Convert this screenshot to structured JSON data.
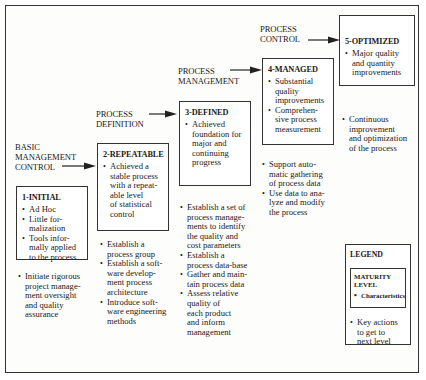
{
  "diagram": {
    "stages": [
      {
        "label_lines": [
          "BASIC",
          "MANAGEMENT",
          "CONTROL"
        ]
      },
      {
        "label_lines": [
          "PROCESS",
          "DEFINITION"
        ]
      },
      {
        "label_lines": [
          "PROCESS",
          "MANAGEMENT"
        ]
      },
      {
        "label_lines": [
          "PROCESS",
          "CONTROL"
        ]
      }
    ],
    "levels": [
      {
        "title": "1-INITIAL",
        "characteristics": [
          "Ad Hoc",
          "Little for-malization",
          "Tools informally applied to the process"
        ],
        "characteristics_lines": [
          [
            "Ad Hoc"
          ],
          [
            "Little for-",
            "malization"
          ],
          [
            "Tools infor-",
            "mally applied",
            "to the process"
          ]
        ],
        "key_actions_lines": [
          [
            "Initiate rigorous",
            "project manage-",
            "ment oversight",
            "and quality",
            "assurance"
          ]
        ]
      },
      {
        "title": "2-REPEATABLE",
        "characteristics_lines": [
          [
            "Achieved a",
            "stable process",
            "with a repeat-",
            "able level",
            "of statistical",
            "control"
          ]
        ],
        "key_actions_lines": [
          [
            "Establish a",
            "process group"
          ],
          [
            "Establish a soft-",
            "ware develop-",
            "ment process",
            "architecture"
          ],
          [
            "Introduce soft-",
            "ware engineering",
            "methods"
          ]
        ]
      },
      {
        "title": "3-DEFINED",
        "characteristics_lines": [
          [
            "Achieved",
            "foundation for",
            "major and",
            "continuing",
            "progress"
          ]
        ],
        "key_actions_lines": [
          [
            "Establish a set of",
            "process manage-",
            "ments to identify",
            "the quality and",
            "cost parameters"
          ],
          [
            "Establish a",
            "process data-base"
          ],
          [
            "Gather and main-",
            "tain process data"
          ],
          [
            "Assess relative",
            "quality of",
            "each product",
            "and inform",
            "management"
          ]
        ]
      },
      {
        "title": "4-MANAGED",
        "characteristics_lines": [
          [
            "Substantial",
            "quality",
            "improvements"
          ],
          [
            "Comprehen-",
            "sive process",
            "measurement"
          ]
        ],
        "key_actions_lines": [
          [
            "Support auto-",
            "matic gathering",
            "of process data"
          ],
          [
            "Use data to ana-",
            "lyze and modify",
            "the process"
          ]
        ]
      },
      {
        "title": "5-OPTIMIZED",
        "characteristics_lines": [
          [
            "Major quality",
            "and quantity",
            "improvements"
          ]
        ],
        "key_actions_lines": [
          [
            "Continuous",
            "improvement",
            "and optimization",
            "of the process"
          ]
        ]
      }
    ],
    "legend": {
      "title": "LEGEND",
      "box_title_lines": [
        "MATURITY",
        "LEVEL"
      ],
      "box_item": "Characteristics",
      "key_lines": [
        "Key actions",
        "to get to",
        "next level"
      ]
    }
  }
}
